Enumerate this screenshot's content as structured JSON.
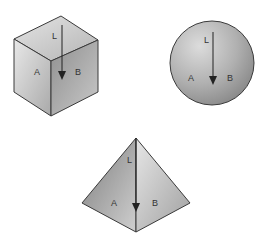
{
  "figures": [
    {
      "shape": "cube",
      "labels": {
        "line": "L",
        "left_face": "A",
        "right_face": "B"
      }
    },
    {
      "shape": "sphere",
      "labels": {
        "line": "L",
        "left": "A",
        "right": "B"
      }
    },
    {
      "shape": "pyramid",
      "labels": {
        "line": "L",
        "left_face": "A",
        "right_face": "B"
      }
    }
  ],
  "colors": {
    "edge": "#3a3a3a",
    "light": "#e2e2e2",
    "mid": "#bdbdbd",
    "dark": "#8e8e8e"
  }
}
